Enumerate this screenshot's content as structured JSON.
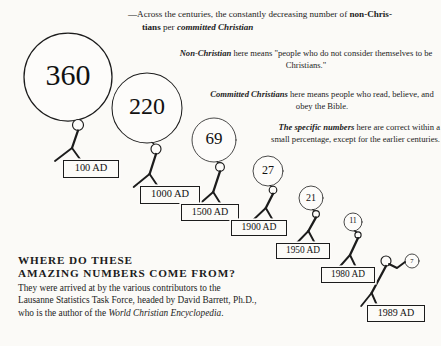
{
  "poster": {
    "title": "Non-Christians per Committed Christian",
    "background_color": "#fbfaf7",
    "ink_color": "#1c1c1c"
  },
  "captions": {
    "headline_line1": "—Across the centuries, the constantly decreasing number of ",
    "headline_bold1": "non-Chris-",
    "headline_line2_bold": "tians",
    "headline_line2_mid": " per ",
    "headline_line2_bold2": "committed Christian",
    "nonchristian_bold": "Non-Christian",
    "nonchristian_rest": " here means \"people who do not consider themselves to be Christians.\"",
    "committed_bold": "Committed Christians",
    "committed_rest": " here means people who read, believe, and obey the Bible.",
    "specific_bold": "The specific numbers",
    "specific_rest": " here are correct within a small percentage, except for the earlier centuries."
  },
  "credit": {
    "heading_line1": "WHERE DO THESE",
    "heading_line2": "AMAZING NUMBERS COME FROM?",
    "body_line1": "They were arrived at by the various contributors to the",
    "body_line2": "Lausanne Statistics Task Force, headed by David Barrett, Ph.D.,",
    "body_line3_pre": "who is the author of the ",
    "body_line3_italic": "World Christian Encyclopedia",
    "body_line3_post": "."
  },
  "chart_data": {
    "type": "bar",
    "xlabel": "Year",
    "ylabel": "Non-Christians per committed Christian",
    "categories": [
      "100 AD",
      "1000 AD",
      "1500 AD",
      "1900 AD",
      "1950 AD",
      "1980 AD",
      "1989 AD"
    ],
    "values": [
      360,
      220,
      69,
      27,
      21,
      11,
      7
    ],
    "grid": false,
    "legend": "none",
    "note": "Each value is drawn as a balloon held by a stick figure; balloon radius scales with the value."
  },
  "figures": [
    {
      "value": "360",
      "year": "100 AD",
      "balloon": {
        "cx": 68,
        "cy": 77,
        "r": 44
      },
      "num_size": 30,
      "head": {
        "cx": 78,
        "cy": 125,
        "r": 5.5
      },
      "label": {
        "x": 63,
        "y": 160,
        "w": 54,
        "h": 16,
        "fs": 10.4
      }
    },
    {
      "value": "220",
      "year": "1000 AD",
      "balloon": {
        "cx": 147,
        "cy": 108,
        "r": 35
      },
      "num_size": 24,
      "head": {
        "cx": 156,
        "cy": 149,
        "r": 5.0
      },
      "label": {
        "x": 140,
        "y": 186,
        "w": 58,
        "h": 16,
        "fs": 10.4
      }
    },
    {
      "value": "69",
      "year": "1500 AD",
      "balloon": {
        "cx": 214,
        "cy": 140,
        "r": 22
      },
      "num_size": 17,
      "head": {
        "cx": 220,
        "cy": 167,
        "r": 4.4
      },
      "label": {
        "x": 181,
        "y": 204,
        "w": 56,
        "h": 15,
        "fs": 10.0
      }
    },
    {
      "value": "27",
      "year": "1900 AD",
      "balloon": {
        "cx": 268,
        "cy": 171,
        "r": 15
      },
      "num_size": 12,
      "head": {
        "cx": 273,
        "cy": 190,
        "r": 3.8
      },
      "label": {
        "x": 231,
        "y": 220,
        "w": 54,
        "h": 14,
        "fs": 9.6
      }
    },
    {
      "value": "21",
      "year": "1950 AD",
      "balloon": {
        "cx": 311,
        "cy": 198,
        "r": 12
      },
      "num_size": 10,
      "head": {
        "cx": 316,
        "cy": 214,
        "r": 3.4
      },
      "label": {
        "x": 276,
        "y": 243,
        "w": 52,
        "h": 14,
        "fs": 9.4
      }
    },
    {
      "value": "11",
      "year": "1980 AD",
      "balloon": {
        "cx": 353,
        "cy": 222,
        "r": 9
      },
      "num_size": 8,
      "head": {
        "cx": 358,
        "cy": 235,
        "r": 3.1
      },
      "label": {
        "x": 321,
        "y": 267,
        "w": 52,
        "h": 14,
        "fs": 9.4
      }
    },
    {
      "value": "7",
      "year": "1989 AD",
      "balloon": {
        "cx": 412,
        "cy": 261,
        "r": 7
      },
      "num_size": 6.6,
      "head": {
        "cx": 386,
        "cy": 261,
        "r": 5.0
      },
      "label": {
        "x": 367,
        "y": 305,
        "w": 56,
        "h": 15,
        "fs": 10.0
      }
    }
  ]
}
